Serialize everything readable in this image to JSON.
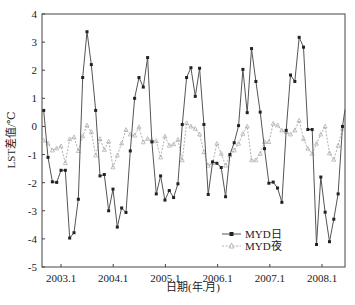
{
  "chart_data": {
    "type": "line",
    "title": "",
    "xlabel": "日期(年.月)",
    "ylabel": "LST差值/℃",
    "ylim": [
      -5,
      4
    ],
    "yticks": [
      4,
      3,
      2,
      1,
      0,
      -1,
      -2,
      -3,
      -4,
      -5
    ],
    "xtick_labels": [
      "2003.1",
      "2004.1",
      "2005.1",
      "2006.1",
      "2007.1",
      "2008.1"
    ],
    "grid": false,
    "legend_position": "lower right",
    "x_start": "2002.9",
    "x_end": "2008.6",
    "x_step": "monthly",
    "series": [
      {
        "name": "MYD日",
        "color": "#555555",
        "marker": "square",
        "values": [
          0.57,
          -1.1,
          -1.97,
          -1.99,
          -1.56,
          -1.56,
          -3.97,
          -3.78,
          -2.59,
          1.74,
          3.37,
          2.2,
          0.57,
          -1.76,
          -1.71,
          -3.0,
          -2.23,
          -3.58,
          -2.9,
          -3.06,
          -0.87,
          1.0,
          1.74,
          1.4,
          2.45,
          -0.55,
          -2.4,
          -1.76,
          -2.62,
          -2.28,
          -2.53,
          -2.04,
          0.07,
          1.74,
          2.09,
          1.07,
          2.07,
          0.07,
          -2.42,
          -1.26,
          -1.31,
          -1.46,
          -2.5,
          -1.0,
          -0.58,
          0.03,
          2.03,
          0.49,
          2.77,
          1.6,
          0.51,
          -0.79,
          -2.02,
          -1.98,
          -2.19,
          -2.7,
          -0.14,
          1.83,
          1.6,
          3.17,
          2.82,
          -0.11,
          -0.11,
          -4.2,
          -1.8,
          -3.05,
          -4.1,
          -3.3,
          -2.4,
          0.0
        ]
      },
      {
        "name": "MYD夜",
        "color": "#b0b0b0",
        "marker": "triangle",
        "values": [
          -0.5,
          -0.6,
          -0.85,
          -0.78,
          -0.7,
          -1.3,
          -0.45,
          -0.38,
          -0.87,
          -0.35,
          0.04,
          -0.2,
          -1.03,
          -0.44,
          -0.83,
          -0.53,
          -1.45,
          -1.03,
          -0.6,
          -0.12,
          -0.28,
          -0.32,
          -0.02,
          -0.56,
          -0.44,
          -0.5,
          -0.52,
          -1.1,
          -0.35,
          -0.68,
          -0.63,
          -0.47,
          -1.2,
          0.12,
          0.0,
          -0.08,
          -0.28,
          -0.91,
          -1.39,
          -1.3,
          -0.61,
          -0.97,
          -1.39,
          -1.03,
          -0.85,
          -0.61,
          -0.26,
          0.0,
          -1.2,
          -1.2,
          -0.97,
          -0.55,
          -0.55,
          0.1,
          0.04,
          -0.14,
          -0.2,
          -0.28,
          -0.14,
          0.21,
          -0.44,
          -0.79,
          -0.97,
          -0.61,
          -0.28,
          0.0,
          -0.95,
          -1.18,
          -0.68,
          -0.08
        ]
      }
    ]
  }
}
